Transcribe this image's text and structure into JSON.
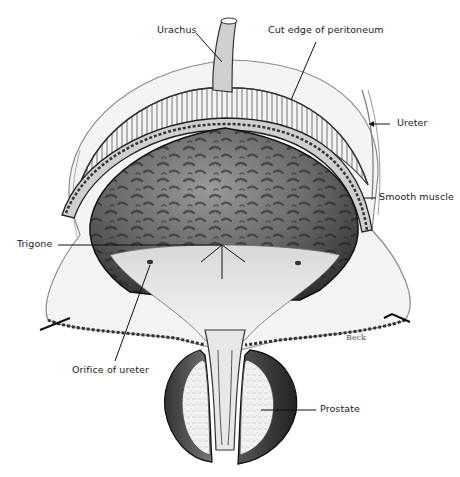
{
  "figure": {
    "artist_signature": "Beck",
    "labels": {
      "urachus": "Urachus",
      "cut_edge_peritoneum": "Cut edge of peritoneum",
      "ureter": "Ureter",
      "smooth_muscle": "Smooth muscle",
      "trigone": "Trigone",
      "orifice_of_ureter": "Orifice of ureter",
      "prostate": "Prostate"
    },
    "colors": {
      "ink": "#1a1a1a",
      "background": "#ffffff",
      "mucosa_dark": "#3a3a3a",
      "tissue_light": "#e8e8e8"
    }
  }
}
